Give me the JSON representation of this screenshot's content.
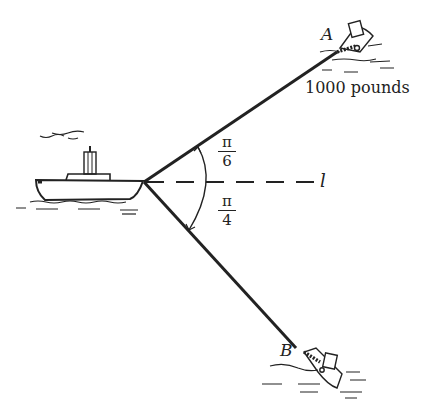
{
  "diagram": {
    "type": "vector force diagram (towing ships)",
    "labels": {
      "point_a": "A",
      "point_b": "B",
      "force_a": "1000 pounds",
      "line": "l"
    },
    "angles": {
      "upper": {
        "numerator": "π",
        "denominator": "6"
      },
      "lower": {
        "numerator": "π",
        "denominator": "4"
      }
    },
    "colors": {
      "ink": "#222222",
      "background": "#ffffff"
    }
  }
}
